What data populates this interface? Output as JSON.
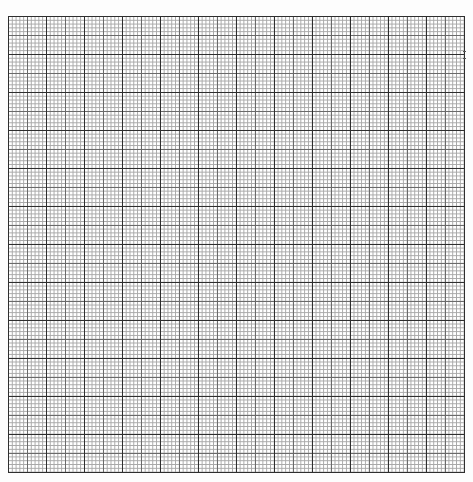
{
  "page": {
    "type": "graph-paper",
    "background_color": "#ffffff",
    "grid": {
      "major_divisions": 12,
      "minor_per_major": 10,
      "major_spacing_px": 38,
      "minor_spacing_px": 3.8,
      "major_line_color": "#2e2e2e",
      "medium_line_color": "#6a6a6a",
      "minor_line_color": "#a8a8a8"
    }
  }
}
